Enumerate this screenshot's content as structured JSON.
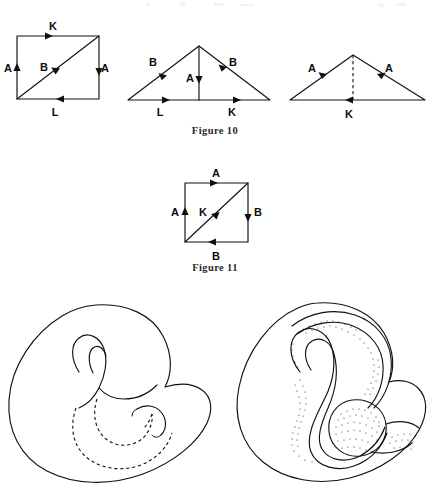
{
  "page": {
    "width": 431,
    "height": 491,
    "background": "#ffffff",
    "ink_color": "#111111"
  },
  "figures": [
    {
      "id": "figure-10",
      "caption": "Figure 10",
      "caption_position": {
        "x": 215,
        "y": 131
      },
      "diagrams": [
        {
          "id": "figure-10-square",
          "shape": "square-with-diagonal",
          "bounds": {
            "x1": 17,
            "y1": 36,
            "x2": 99,
            "y2": 99
          },
          "edges": [
            {
              "name": "top-edge",
              "label": "K",
              "label_x": 53,
              "label_y": 30,
              "arrow_direction": "right"
            },
            {
              "name": "left-edge",
              "label": "A",
              "label_x": 8,
              "label_y": 72,
              "arrow_direction": "up"
            },
            {
              "name": "right-edge",
              "label": "A",
              "label_x": 103,
              "label_y": 72,
              "arrow_direction": "down"
            },
            {
              "name": "bottom-edge",
              "label": "L",
              "label_x": 55,
              "label_y": 116,
              "arrow_direction": "left"
            },
            {
              "name": "diagonal-edge",
              "label": "B",
              "label_x": 44,
              "label_y": 70,
              "arrow_direction": "up-right"
            }
          ]
        },
        {
          "id": "figure-10-triangle-middle",
          "shape": "triangle-with-median",
          "apex": {
            "x": 199,
            "y": 46
          },
          "base_left": {
            "x": 128,
            "y": 100
          },
          "base_right": {
            "x": 270,
            "y": 100
          },
          "edges": [
            {
              "name": "left-slope",
              "label": "B",
              "label_x": 153,
              "label_y": 65,
              "arrow_direction": "up-right"
            },
            {
              "name": "right-slope",
              "label": "B",
              "label_x": 229,
              "label_y": 66,
              "arrow_direction": "down-right"
            },
            {
              "name": "median-edge",
              "label": "A",
              "label_x": 190,
              "label_y": 80,
              "arrow_direction": "down"
            },
            {
              "name": "base-left-half",
              "label": "L",
              "label_x": 160,
              "label_y": 116,
              "arrow_direction": "right"
            },
            {
              "name": "base-right-half",
              "label": "K",
              "label_x": 232,
              "label_y": 116,
              "arrow_direction": "right"
            }
          ]
        },
        {
          "id": "figure-10-triangle-right",
          "shape": "triangle-with-dashed-median",
          "apex": {
            "x": 353,
            "y": 55
          },
          "base_left": {
            "x": 290,
            "y": 100
          },
          "base_right": {
            "x": 425,
            "y": 100
          },
          "edges": [
            {
              "name": "left-slope",
              "label": "A",
              "label_x": 312,
              "label_y": 71,
              "arrow_direction": "up-right"
            },
            {
              "name": "right-slope",
              "label": "A",
              "label_x": 387,
              "label_y": 71,
              "arrow_direction": "up-left"
            },
            {
              "name": "median-edge",
              "label": "",
              "label_x": 0,
              "label_y": 0,
              "arrow_direction": "none",
              "style": "dashed"
            },
            {
              "name": "base-edge",
              "label": "K",
              "label_x": 349,
              "label_y": 117,
              "arrow_direction": "left"
            }
          ]
        }
      ]
    },
    {
      "id": "figure-11",
      "caption": "Figure 11",
      "caption_position": {
        "x": 215,
        "y": 268
      },
      "diagrams": [
        {
          "id": "figure-11-square",
          "shape": "square-with-diagonal",
          "bounds": {
            "x1": 185,
            "y1": 183,
            "x2": 248,
            "y2": 242
          },
          "edges": [
            {
              "name": "top-edge",
              "label": "A",
              "label_x": 216,
              "label_y": 176,
              "arrow_direction": "right"
            },
            {
              "name": "left-edge",
              "label": "A",
              "label_x": 176,
              "label_y": 216,
              "arrow_direction": "up"
            },
            {
              "name": "right-edge",
              "label": "B",
              "label_x": 256,
              "label_y": 216,
              "arrow_direction": "down"
            },
            {
              "name": "bottom-edge",
              "label": "B",
              "label_x": 216,
              "label_y": 259,
              "arrow_direction": "left"
            },
            {
              "name": "diagonal-edge",
              "label": "K",
              "label_x": 205,
              "label_y": 215,
              "arrow_direction": "down-left"
            }
          ]
        }
      ]
    },
    {
      "id": "klein-bottle-outline",
      "caption": "",
      "type": "illustration",
      "style": "line-drawing-with-hidden-dashed-contours",
      "bounds": {
        "x": 8,
        "y": 300,
        "width": 205,
        "height": 185
      }
    },
    {
      "id": "klein-bottle-shaded",
      "caption": "",
      "type": "illustration",
      "style": "stippled-shaded-drawing",
      "bounds": {
        "x": 225,
        "y": 300,
        "width": 200,
        "height": 185
      }
    }
  ]
}
